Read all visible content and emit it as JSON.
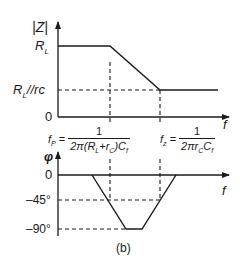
{
  "figure": {
    "caption": "(b)",
    "colors": {
      "ink": "#1a1a1a",
      "background": "#ffffff"
    }
  },
  "magnitude_plot": {
    "y_axis_label": "|Z|",
    "x_axis_label": "f",
    "y_ticks": [
      "R_L",
      "R_L||rc",
      "0"
    ],
    "tick_labels": {
      "rl": "R",
      "rl_sub": "L",
      "rlrc": "R",
      "rlrc_sub": "L",
      "rlrc_rest": "//rc",
      "zero": "0"
    },
    "segments": [
      {
        "desc": "flat at R_L",
        "from": "0",
        "to": "f_p"
      },
      {
        "desc": "sloping down",
        "from": "f_p",
        "to": "f_z"
      },
      {
        "desc": "flat at R_L||rc",
        "from": "f_z",
        "to": "end"
      }
    ]
  },
  "formulas": {
    "fp": {
      "lhs": "f",
      "lhs_sub": "P",
      "eq": "=",
      "num": "1",
      "den": "2π(R_L + r_C)C_f",
      "den_text": "2π(R",
      "den_sub1": "L",
      "den_mid": "+r",
      "den_sub2": "C",
      "den_end": ")C",
      "den_sub3": "f"
    },
    "fz": {
      "lhs": "f",
      "lhs_sub": "z",
      "eq": "=",
      "num": "1",
      "den": "2πr_C C_f",
      "den_text": "2πr",
      "den_sub1": "C",
      "den_mid": "C",
      "den_sub2": "f"
    }
  },
  "phase_plot": {
    "y_axis_label": "φ",
    "x_axis_label": "f",
    "y_ticks": [
      "0",
      "-45°",
      "-90°"
    ],
    "tick_labels": {
      "zero": "0",
      "m45": "–45°",
      "m90": "–90°"
    },
    "crossings": [
      "-45° at f_p",
      "-45° at f_z"
    ]
  }
}
